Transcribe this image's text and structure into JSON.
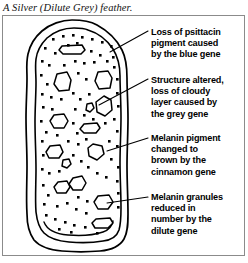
{
  "caption": "A Silver (Dilute Grey) feather.",
  "figure": {
    "ink_color": "#000000",
    "frame_color": "#8b8b8b",
    "background_color": "#ffffff"
  },
  "annotations": [
    {
      "name": "blue-gene",
      "lines": [
        "Loss of psittacin",
        "pigment caused",
        "by the blue gene"
      ],
      "leader": {
        "x1": 148,
        "y1": 31,
        "x2": 110,
        "y2": 52
      }
    },
    {
      "name": "grey-gene",
      "lines": [
        "Structure altered,",
        "loss of cloudy",
        "layer caused by",
        "the grey gene"
      ],
      "leader": {
        "x1": 148,
        "y1": 79,
        "x2": 99,
        "y2": 105
      }
    },
    {
      "name": "cinnamon-gene",
      "lines": [
        "Melanin pigment",
        "changed to",
        "brown by the",
        "cinnamon gene"
      ],
      "leader": {
        "x1": 148,
        "y1": 138,
        "x2": 107,
        "y2": 151
      }
    },
    {
      "name": "dilute-gene",
      "lines": [
        "Melanin granules",
        "reduced in",
        "number by the",
        "dilute gene"
      ],
      "leader": {
        "x1": 148,
        "y1": 197,
        "x2": 107,
        "y2": 203
      }
    }
  ]
}
